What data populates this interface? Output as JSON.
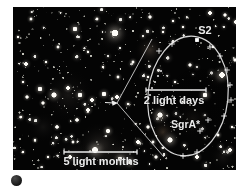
{
  "figure": {
    "type": "annotated-astronomy-photo",
    "labels": {
      "s2": "S2",
      "inner_scale": "2 light days",
      "black_hole": "SgrA*",
      "outer_scale": "5 light months"
    },
    "colors": {
      "page_bg": "#ffffff",
      "photo_bg": "#040404",
      "overlay": "#ececec"
    },
    "overlay": {
      "ellipse": {
        "cx": 175,
        "cy": 89,
        "rx": 40,
        "ry": 60,
        "rot": 6
      },
      "callout_origin": [
        104,
        96
      ],
      "callout_top": [
        139,
        32
      ],
      "callout_bottom": [
        151,
        150
      ],
      "inner_bar": {
        "x1": 133,
        "x2": 193,
        "y": 83
      },
      "outer_bar": {
        "x1": 51,
        "x2": 124,
        "y": 145
      },
      "markers_plus": [
        [
          146,
          44
        ],
        [
          159,
          37
        ],
        [
          197,
          40
        ],
        [
          207,
          49
        ],
        [
          214,
          63
        ],
        [
          217,
          78
        ],
        [
          218,
          93
        ],
        [
          211,
          109
        ],
        [
          195,
          113
        ],
        [
          187,
          124
        ],
        [
          184,
          145
        ],
        [
          170,
          149
        ]
      ],
      "markers_dot": [
        [
          137,
          88
        ],
        [
          139,
          81
        ],
        [
          142,
          75
        ],
        [
          145,
          69
        ],
        [
          148,
          64
        ]
      ],
      "marker_square": [
        184,
        33
      ]
    }
  }
}
